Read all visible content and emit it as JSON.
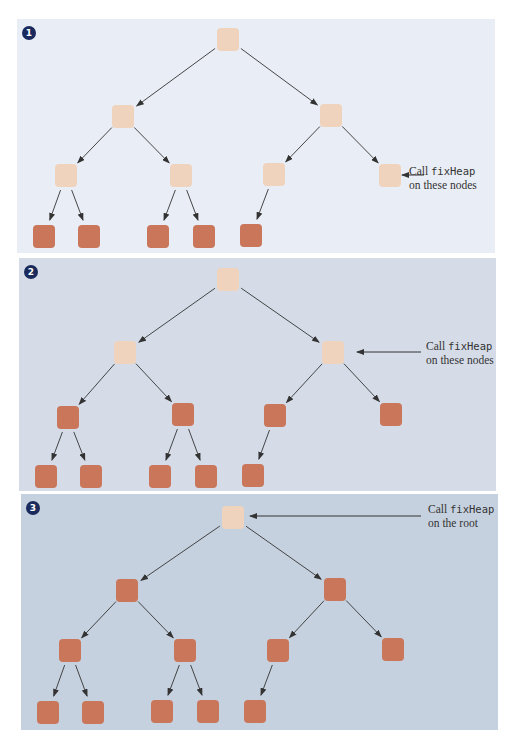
{
  "colors": {
    "pending_node": "#f0d3bd",
    "heap_node": "#c9765a",
    "badge": "#1b2a5c",
    "arrow": "#333333"
  },
  "panels": [
    {
      "step": "1",
      "bg": "#e9edf5",
      "box": {
        "x": 17,
        "y": 19,
        "w": 478,
        "h": 234
      },
      "label": {
        "line1_prefix": "Call ",
        "line1_code": "fixHeap",
        "line2": "on these nodes",
        "x": 409,
        "y": 164
      },
      "nodes": {
        "root": {
          "x": 228,
          "y": 39,
          "state": "pending"
        },
        "l1": [
          {
            "x": 123,
            "y": 116,
            "state": "pending"
          },
          {
            "x": 331,
            "y": 115,
            "state": "pending"
          }
        ],
        "l2": [
          {
            "x": 66,
            "y": 175,
            "state": "pending"
          },
          {
            "x": 181,
            "y": 175,
            "state": "pending"
          },
          {
            "x": 274,
            "y": 174,
            "state": "pending"
          },
          {
            "x": 390,
            "y": 175,
            "state": "pending"
          }
        ],
        "l3": [
          {
            "x": 44,
            "y": 236,
            "state": "heap"
          },
          {
            "x": 89,
            "y": 236,
            "state": "heap"
          },
          {
            "x": 158,
            "y": 236,
            "state": "heap"
          },
          {
            "x": 204,
            "y": 236,
            "state": "heap"
          },
          {
            "x": 251,
            "y": 235,
            "state": "heap"
          }
        ]
      },
      "pointer": {
        "x1": 424,
        "y1": 175,
        "x2": 402,
        "y2": 175
      }
    },
    {
      "step": "2",
      "bg": "#d5dce8",
      "box": {
        "x": 19,
        "y": 258,
        "w": 477,
        "h": 233
      },
      "label": {
        "line1_prefix": "Call ",
        "line1_code": "fixHeap",
        "line2": "on these nodes",
        "x": 426,
        "y": 339
      },
      "nodes": {
        "root": {
          "x": 228,
          "y": 279,
          "state": "pending"
        },
        "l1": [
          {
            "x": 125,
            "y": 352,
            "state": "pending"
          },
          {
            "x": 333,
            "y": 352,
            "state": "pending"
          }
        ],
        "l2": [
          {
            "x": 68,
            "y": 417,
            "state": "heap"
          },
          {
            "x": 183,
            "y": 414,
            "state": "heap"
          },
          {
            "x": 275,
            "y": 415,
            "state": "heap"
          },
          {
            "x": 391,
            "y": 414,
            "state": "heap"
          }
        ],
        "l3": [
          {
            "x": 46,
            "y": 476,
            "state": "heap"
          },
          {
            "x": 91,
            "y": 476,
            "state": "heap"
          },
          {
            "x": 160,
            "y": 476,
            "state": "heap"
          },
          {
            "x": 206,
            "y": 476,
            "state": "heap"
          },
          {
            "x": 253,
            "y": 475,
            "state": "heap"
          }
        ]
      },
      "pointer": {
        "x1": 421,
        "y1": 352,
        "x2": 357,
        "y2": 352
      }
    },
    {
      "step": "3",
      "bg": "#c6d1df",
      "box": {
        "x": 21,
        "y": 494,
        "w": 477,
        "h": 236
      },
      "label": {
        "line1_prefix": "Call ",
        "line1_code": "fixHeap",
        "line2": "on the root",
        "x": 428,
        "y": 502
      },
      "nodes": {
        "root": {
          "x": 233,
          "y": 517,
          "state": "pending"
        },
        "l1": [
          {
            "x": 127,
            "y": 590,
            "state": "heap"
          },
          {
            "x": 335,
            "y": 589,
            "state": "heap"
          }
        ],
        "l2": [
          {
            "x": 70,
            "y": 650,
            "state": "heap"
          },
          {
            "x": 185,
            "y": 650,
            "state": "heap"
          },
          {
            "x": 278,
            "y": 650,
            "state": "heap"
          },
          {
            "x": 393,
            "y": 649,
            "state": "heap"
          }
        ],
        "l3": [
          {
            "x": 48,
            "y": 712,
            "state": "heap"
          },
          {
            "x": 93,
            "y": 712,
            "state": "heap"
          },
          {
            "x": 162,
            "y": 711,
            "state": "heap"
          },
          {
            "x": 208,
            "y": 711,
            "state": "heap"
          },
          {
            "x": 255,
            "y": 711,
            "state": "heap"
          }
        ]
      },
      "pointer": {
        "x1": 421,
        "y1": 516,
        "x2": 250,
        "y2": 516
      }
    }
  ]
}
